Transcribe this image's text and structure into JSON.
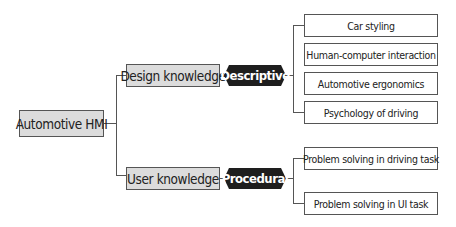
{
  "diagram": {
    "type": "mind-map",
    "root": {
      "label": "Automotive HMI"
    },
    "branches": [
      {
        "label": "Design knowledge",
        "tag": "Descriptive",
        "children": [
          "Car styling",
          "Human-computer interaction",
          "Automotive ergonomics",
          "Psychology of driving"
        ]
      },
      {
        "label": "User knowledge",
        "tag": "Procedural",
        "children": [
          "Problem solving in driving task",
          "Problem solving in UI task"
        ]
      }
    ],
    "colors": {
      "node_fill": "#dcdcdc",
      "tag_fill": "#1e1e1e",
      "leaf_fill": "#ffffff",
      "line": "#555555"
    }
  }
}
